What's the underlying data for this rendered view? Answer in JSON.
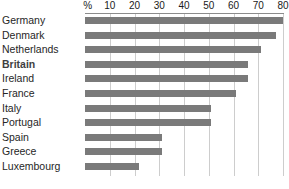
{
  "chart_data": {
    "type": "bar",
    "orientation": "horizontal",
    "title": "",
    "subtitle": "",
    "xlabel": "%",
    "ylabel": "",
    "unit_label": "%",
    "categories": [
      "Germany",
      "Denmark",
      "Netherlands",
      "Britain",
      "Ireland",
      "France",
      "Italy",
      "Portugal",
      "Spain",
      "Greece",
      "Luxembourg"
    ],
    "values": [
      80,
      77,
      71,
      66,
      66,
      61,
      51,
      51,
      31,
      31,
      22
    ],
    "series": [
      {
        "name": "",
        "values": [
          80,
          77,
          71,
          66,
          66,
          61,
          51,
          51,
          31,
          31,
          22
        ]
      }
    ],
    "xlim": [
      0,
      80
    ],
    "ylim": [
      0,
      11
    ],
    "xticks": [
      10,
      20,
      30,
      40,
      50,
      60,
      70,
      80
    ],
    "xtick_labels": [
      "10",
      "20",
      "30",
      "40",
      "50",
      "60",
      "70",
      "80"
    ],
    "grid": true,
    "grid_axis": "x",
    "legend": false,
    "legend_position": "none",
    "annotations": [],
    "highlighted_categories": [
      "Britain"
    ],
    "colors": {
      "bar": "#7a7a7a",
      "gridline": "#cdcdcd",
      "axis_line": "#8c8c8c",
      "label_text": "#262626",
      "tick_text": "#1a1a1a",
      "highlight_text": "#3f3f3f",
      "background": "#ffffff"
    }
  }
}
